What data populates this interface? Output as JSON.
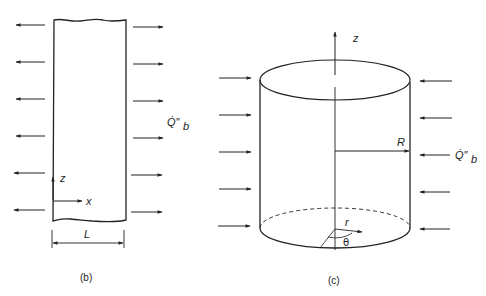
{
  "figure_b": {
    "caption": "(b)",
    "labels": {
      "z_axis": "z",
      "x_axis": "x",
      "width": "L",
      "heat_flux": "Q̇″",
      "heat_flux_sub": "b"
    },
    "description": "Slab of width L with heat flux arrows leaving both faces"
  },
  "figure_c": {
    "caption": "(c)",
    "labels": {
      "z_axis": "z",
      "radius": "R",
      "r_coord": "r",
      "theta_coord": "θ",
      "heat_flux": "Q̇″",
      "heat_flux_sub": "b"
    },
    "description": "Cylinder of radius R with heat flux arrows entering the lateral surface"
  },
  "colors": {
    "line": "#222222",
    "background": "#ffffff"
  }
}
